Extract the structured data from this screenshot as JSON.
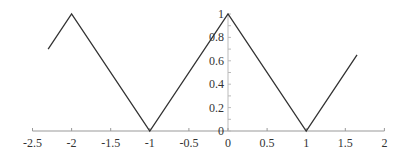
{
  "chart_data": {
    "type": "line",
    "title": "",
    "xlabel": "",
    "ylabel": "",
    "xlim": [
      -2.5,
      2
    ],
    "ylim": [
      0,
      1
    ],
    "grid": false,
    "legend": null,
    "x_ticks": [
      -2.5,
      -2,
      -1.5,
      -1,
      -0.5,
      0,
      0.5,
      1,
      1.5,
      2
    ],
    "x_tick_labels": [
      "-2.5",
      "-2",
      "-1.5",
      "-1",
      "-0.5",
      "0",
      "0.5",
      "1",
      "1.5",
      "2"
    ],
    "y_ticks": [
      0,
      0.2,
      0.4,
      0.6,
      0.8,
      1
    ],
    "y_tick_labels": [
      "0",
      "0.2",
      "0.4",
      "0.6",
      "0.8",
      "1"
    ],
    "series": [
      {
        "name": "triangle wave",
        "color": "#333333",
        "x": [
          -2.3,
          -2,
          -1,
          0,
          1,
          1.65
        ],
        "y": [
          0.7,
          1,
          0,
          1,
          0,
          0.65
        ]
      }
    ]
  }
}
